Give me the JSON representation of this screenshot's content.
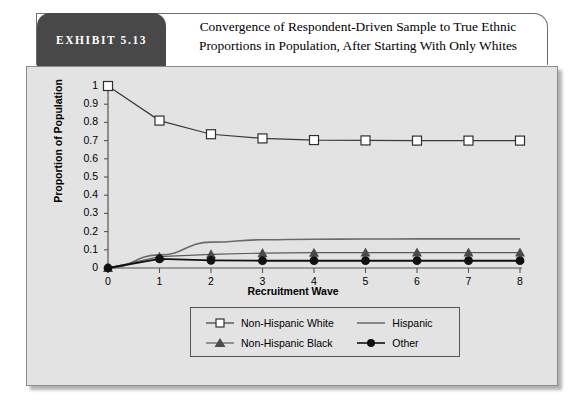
{
  "exhibit": {
    "badge_label": "EXHIBIT 5.13",
    "title_line1": "Convergence of Respondent-Driven Sample to True Ethnic",
    "title_line2": "Proportions in Population, After Starting With Only Whites"
  },
  "colors": {
    "panel_bg": "#e3e3e3",
    "badge_bg": "#484848",
    "axis": "#555555",
    "white_series": "#3a3a3a",
    "hispanic_series": "#6b6b6b",
    "black_series": "#5a5a5a",
    "other_series": "#111111"
  },
  "chart_data": {
    "type": "line",
    "title": "Convergence of Respondent-Driven Sample to True Ethnic Proportions in Population, After Starting With Only Whites",
    "xlabel": "Recruitment Wave",
    "ylabel": "Proportion of Population",
    "x": [
      0,
      1,
      2,
      3,
      4,
      5,
      6,
      7,
      8
    ],
    "xlim": [
      0,
      8
    ],
    "ylim": [
      0,
      1
    ],
    "xticks": [
      "0",
      "1",
      "2",
      "3",
      "4",
      "5",
      "6",
      "7",
      "8"
    ],
    "yticks": [
      "0",
      "0.1",
      "0.2",
      "0.3",
      "0.4",
      "0.5",
      "0.6",
      "0.7",
      "0.8",
      "0.9",
      "1"
    ],
    "grid": false,
    "legend_position": "bottom-center",
    "series": [
      {
        "name": "Non-Hispanic White",
        "marker": "open-square",
        "values": [
          1.0,
          0.81,
          0.735,
          0.712,
          0.703,
          0.701,
          0.7,
          0.7,
          0.7
        ]
      },
      {
        "name": "Hispanic",
        "marker": "none",
        "values": [
          0.0,
          0.072,
          0.142,
          0.155,
          0.158,
          0.159,
          0.16,
          0.16,
          0.16
        ]
      },
      {
        "name": "Non-Hispanic Black",
        "marker": "filled-triangle",
        "values": [
          0.0,
          0.062,
          0.075,
          0.082,
          0.084,
          0.085,
          0.085,
          0.085,
          0.085
        ]
      },
      {
        "name": "Other",
        "marker": "filled-circle",
        "values": [
          0.0,
          0.05,
          0.042,
          0.04,
          0.04,
          0.04,
          0.04,
          0.04,
          0.04
        ]
      }
    ]
  },
  "legend": {
    "items": [
      {
        "label": "Non-Hispanic White",
        "marker": "open-square"
      },
      {
        "label": "Hispanic",
        "marker": "none"
      },
      {
        "label": "Non-Hispanic Black",
        "marker": "filled-triangle"
      },
      {
        "label": "Other",
        "marker": "filled-circle"
      }
    ]
  }
}
